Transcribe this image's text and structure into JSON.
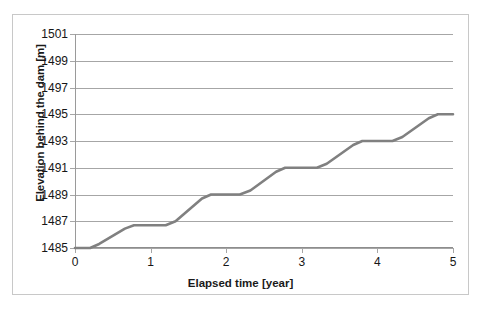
{
  "chart_data": {
    "type": "line",
    "title": "",
    "xlabel": "Elapsed time [year]",
    "ylabel": "Elevation behind the dam [m]",
    "xlim": [
      0,
      5
    ],
    "ylim": [
      1485,
      1501
    ],
    "xticks": [
      0,
      1,
      2,
      3,
      4,
      5
    ],
    "yticks": [
      1485,
      1487,
      1489,
      1491,
      1493,
      1495,
      1497,
      1499,
      1501
    ],
    "xtick_labels": [
      "0",
      "1",
      "2",
      "3",
      "4",
      "5"
    ],
    "ytick_labels": [
      "1485",
      "1487",
      "1489",
      "1491",
      "1493",
      "1495",
      "1497",
      "1499",
      "1501"
    ],
    "grid": "horizontal",
    "legend": "none",
    "series": [
      {
        "name": "Elevation behind the dam",
        "color": "#808080",
        "line_width": 2.6,
        "x": [
          0.0,
          0.2,
          0.32,
          0.66,
          0.78,
          1.2,
          1.33,
          1.68,
          1.8,
          2.18,
          2.32,
          2.66,
          2.78,
          3.2,
          3.33,
          3.68,
          3.8,
          4.2,
          4.33,
          4.68,
          4.8,
          5.0
        ],
        "y": [
          1485.0,
          1485.0,
          1485.3,
          1486.45,
          1486.7,
          1486.7,
          1487.0,
          1488.7,
          1489.0,
          1489.0,
          1489.3,
          1490.7,
          1491.0,
          1491.0,
          1491.3,
          1492.7,
          1493.0,
          1493.0,
          1493.3,
          1494.7,
          1495.0,
          1495.0
        ]
      }
    ]
  },
  "axes": {
    "y_title": "Elevation behind the dam [m]",
    "x_title": "Elapsed time [year]",
    "grid_color": "#a6a6a6",
    "frame_color": "#c8c8c8",
    "line_color": "#808080",
    "text_color": "#161616"
  }
}
